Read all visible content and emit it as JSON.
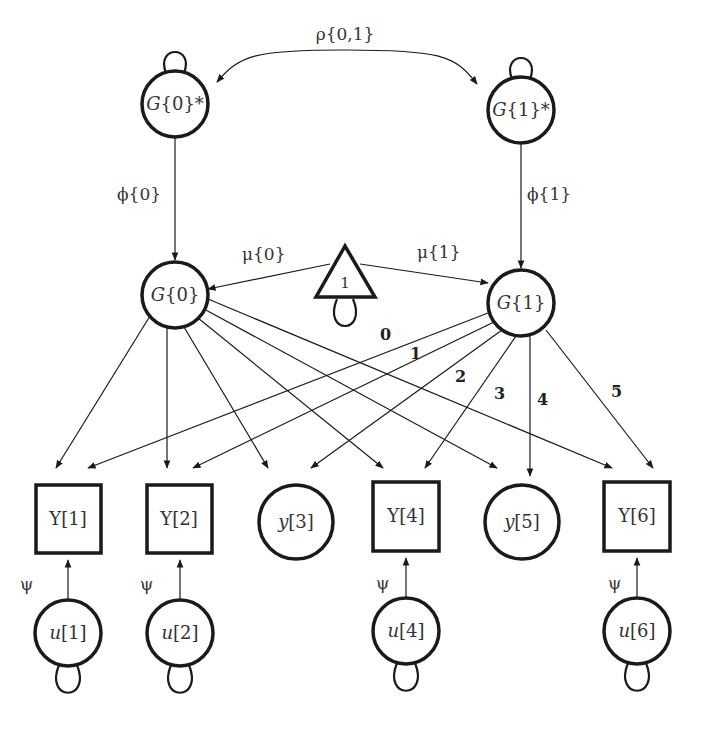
{
  "diagram": {
    "type": "path-diagram",
    "colors": {
      "stroke": "#1a1a1a",
      "text": "#333333",
      "background": "#ffffff"
    },
    "nodes": [
      {
        "id": "G0star",
        "shape": "circle",
        "label_main": "G",
        "label_rest": "{0}*",
        "cx": 175,
        "cy": 104,
        "r": 33,
        "self_loop": "top"
      },
      {
        "id": "G1star",
        "shape": "circle",
        "label_main": "G",
        "label_rest": "{1}*",
        "cx": 521,
        "cy": 110,
        "r": 33,
        "self_loop": "top"
      },
      {
        "id": "G0",
        "shape": "circle",
        "label_main": "G",
        "label_rest": "{0}",
        "cx": 175,
        "cy": 295,
        "r": 33
      },
      {
        "id": "G1",
        "shape": "circle",
        "label_main": "G",
        "label_rest": "{1}",
        "cx": 521,
        "cy": 303,
        "r": 33
      },
      {
        "id": "const",
        "shape": "triangle",
        "label": "1",
        "cx": 345,
        "cy": 275,
        "self_loop": "bottom"
      },
      {
        "id": "Y1",
        "shape": "square",
        "label": "Y[1]",
        "x": 36,
        "y": 485,
        "w": 65,
        "h": 68
      },
      {
        "id": "Y2",
        "shape": "square",
        "label": "Y[2]",
        "x": 147,
        "y": 485,
        "w": 65,
        "h": 68
      },
      {
        "id": "y3",
        "shape": "circle",
        "label_main": "y",
        "label_rest": "[3]",
        "cx": 296,
        "cy": 522,
        "r": 37
      },
      {
        "id": "Y4",
        "shape": "square",
        "label": "Y[4]",
        "x": 373,
        "y": 482,
        "w": 66,
        "h": 69
      },
      {
        "id": "y5",
        "shape": "circle",
        "label_main": "y",
        "label_rest": "[5]",
        "cx": 522,
        "cy": 522,
        "r": 37
      },
      {
        "id": "Y6",
        "shape": "square",
        "label": "Y[6]",
        "x": 604,
        "y": 482,
        "w": 66,
        "h": 69
      },
      {
        "id": "u1",
        "shape": "circle",
        "label_main": "u",
        "label_rest": "[1]",
        "cx": 68,
        "cy": 633,
        "r": 33,
        "self_loop": "bottom"
      },
      {
        "id": "u2",
        "shape": "circle",
        "label_main": "u",
        "label_rest": "[2]",
        "cx": 180,
        "cy": 633,
        "r": 33,
        "self_loop": "bottom"
      },
      {
        "id": "u4",
        "shape": "circle",
        "label_main": "u",
        "label_rest": "[4]",
        "cx": 406,
        "cy": 631,
        "r": 33,
        "self_loop": "bottom"
      },
      {
        "id": "u6",
        "shape": "circle",
        "label_main": "u",
        "label_rest": "[6]",
        "cx": 637,
        "cy": 631,
        "r": 33,
        "self_loop": "bottom"
      }
    ],
    "edge_labels": {
      "rho": "ρ{0,1}",
      "phi0": "ϕ{0}",
      "phi1": "ϕ{1}",
      "mu0": "μ{0}",
      "mu1": "μ{1}",
      "psi": "ψ",
      "loadings": [
        "0",
        "1",
        "2",
        "3",
        "4",
        "5"
      ]
    },
    "edges": [
      {
        "from": "G0star",
        "to": "G0",
        "label": "ϕ{0}"
      },
      {
        "from": "G1star",
        "to": "G1",
        "label": "ϕ{1}"
      },
      {
        "from": "G0star",
        "to": "G1star",
        "label": "ρ{0,1}",
        "bidirectional": true
      },
      {
        "from": "const",
        "to": "G0",
        "label": "μ{0}"
      },
      {
        "from": "const",
        "to": "G1",
        "label": "μ{1}"
      },
      {
        "from": "G0",
        "to": "Y1"
      },
      {
        "from": "G0",
        "to": "Y2"
      },
      {
        "from": "G0",
        "to": "y3"
      },
      {
        "from": "G0",
        "to": "Y4"
      },
      {
        "from": "G0",
        "to": "y5"
      },
      {
        "from": "G0",
        "to": "Y6"
      },
      {
        "from": "G1",
        "to": "Y1",
        "label": "0"
      },
      {
        "from": "G1",
        "to": "Y2",
        "label": "1"
      },
      {
        "from": "G1",
        "to": "y3",
        "label": "2"
      },
      {
        "from": "G1",
        "to": "Y4",
        "label": "3"
      },
      {
        "from": "G1",
        "to": "y5",
        "label": "4"
      },
      {
        "from": "G1",
        "to": "Y6",
        "label": "5"
      },
      {
        "from": "u1",
        "to": "Y1",
        "label": "ψ"
      },
      {
        "from": "u2",
        "to": "Y2",
        "label": "ψ"
      },
      {
        "from": "u4",
        "to": "Y4",
        "label": "ψ"
      },
      {
        "from": "u6",
        "to": "Y6",
        "label": "ψ"
      }
    ]
  }
}
